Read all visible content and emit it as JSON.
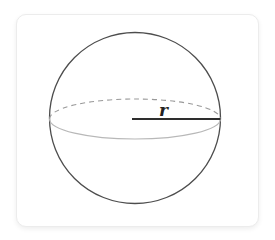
{
  "diagram": {
    "type": "sphere-with-radius",
    "radius_label": "r",
    "colors": {
      "card_background": "#ffffff",
      "card_border": "#ececec",
      "sphere_outline": "#4d4d4d",
      "equator_back_dashed": "#999999",
      "equator_front": "#b8b8b8",
      "radius_line": "#2e2e2e",
      "label": "#222222"
    }
  }
}
